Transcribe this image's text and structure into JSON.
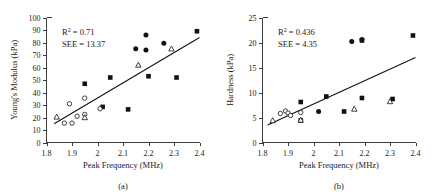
{
  "figure": {
    "panels": [
      {
        "id": "a",
        "caption": "(a)",
        "xlabel": "Peak Frequency (MHz)",
        "ylabel": "Young's Modulus (kPa)",
        "r2_label": "R2 = 0.71",
        "r2_prefix": "R",
        "r2_sup": "2",
        "r2_value": " = 0.71",
        "see_label": "SEE = 13.37",
        "xticks": [
          "1.8",
          "1.9",
          "2",
          "2.1",
          "2.2",
          "2.3",
          "2.4"
        ],
        "yticks": [
          "0",
          "10",
          "20",
          "30",
          "40",
          "50",
          "60",
          "70",
          "80",
          "90",
          "100"
        ]
      },
      {
        "id": "b",
        "caption": "(b)",
        "xlabel": "Peak Frequency (MHz)",
        "ylabel": "Hardness (kPa)",
        "r2_label": "R2 = 0.436",
        "r2_prefix": "R",
        "r2_sup": "2",
        "r2_value": " = 0.436",
        "see_label": "SEE = 4.35",
        "xticks": [
          "1.8",
          "1.9",
          "2",
          "2.1",
          "2.2",
          "2.3",
          "2.4"
        ],
        "yticks": [
          "0",
          "5",
          "10",
          "15",
          "20",
          "25"
        ]
      }
    ]
  },
  "chart_data": [
    {
      "type": "scatter",
      "panel": "a",
      "title": "",
      "xlabel": "Peak Frequency (MHz)",
      "ylabel": "Young's Modulus (kPa)",
      "xlim": [
        1.8,
        2.4
      ],
      "ylim": [
        0,
        100
      ],
      "xticks": [
        1.8,
        1.9,
        2.0,
        2.1,
        2.2,
        2.3,
        2.4
      ],
      "yticks": [
        0,
        10,
        20,
        30,
        40,
        50,
        60,
        70,
        80,
        90,
        100
      ],
      "grid": false,
      "legend": "none",
      "annotations": [
        "R2 = 0.71",
        "SEE = 13.37"
      ],
      "r_squared": 0.71,
      "see": 13.37,
      "fit_line": {
        "x": [
          1.83,
          2.4
        ],
        "y": [
          15.0,
          84.0
        ]
      },
      "series": [
        {
          "name": "filled-square",
          "marker": "filled-square",
          "points": [
            {
              "x": 1.95,
              "y": 47.0
            },
            {
              "x": 2.02,
              "y": 28.5
            },
            {
              "x": 2.05,
              "y": 52.0
            },
            {
              "x": 2.12,
              "y": 26.5
            },
            {
              "x": 2.2,
              "y": 53.0
            },
            {
              "x": 2.31,
              "y": 52.0
            },
            {
              "x": 2.39,
              "y": 89.0
            }
          ]
        },
        {
          "name": "filled-circle",
          "marker": "filled-circle",
          "points": [
            {
              "x": 2.15,
              "y": 75.0
            },
            {
              "x": 2.19,
              "y": 86.0
            },
            {
              "x": 2.19,
              "y": 74.0
            },
            {
              "x": 2.26,
              "y": 79.5
            }
          ]
        },
        {
          "name": "open-circle",
          "marker": "open-circle",
          "points": [
            {
              "x": 1.87,
              "y": 15.5
            },
            {
              "x": 1.89,
              "y": 31.0
            },
            {
              "x": 1.9,
              "y": 15.5
            },
            {
              "x": 1.92,
              "y": 21.0
            },
            {
              "x": 1.95,
              "y": 35.5
            },
            {
              "x": 1.95,
              "y": 22.5
            },
            {
              "x": 2.01,
              "y": 27.0
            }
          ]
        },
        {
          "name": "open-triangle",
          "marker": "open-triangle",
          "points": [
            {
              "x": 1.84,
              "y": 20.5
            },
            {
              "x": 1.95,
              "y": 20.0
            },
            {
              "x": 2.16,
              "y": 62.0
            },
            {
              "x": 2.29,
              "y": 75.0
            }
          ]
        }
      ]
    },
    {
      "type": "scatter",
      "panel": "b",
      "title": "",
      "xlabel": "Peak Frequency (MHz)",
      "ylabel": "Hardness (kPa)",
      "xlim": [
        1.8,
        2.4
      ],
      "ylim": [
        0,
        25
      ],
      "xticks": [
        1.8,
        1.9,
        2.0,
        2.1,
        2.2,
        2.3,
        2.4
      ],
      "yticks": [
        0,
        5,
        10,
        15,
        20,
        25
      ],
      "grid": false,
      "legend": "none",
      "annotations": [
        "R2 = 0.436",
        "SEE = 4.35"
      ],
      "r_squared": 0.436,
      "see": 4.35,
      "fit_line": {
        "x": [
          1.82,
          2.4
        ],
        "y": [
          3.5,
          17.0
        ]
      },
      "series": [
        {
          "name": "filled-square",
          "marker": "filled-square",
          "points": [
            {
              "x": 1.95,
              "y": 8.1
            },
            {
              "x": 1.95,
              "y": 4.4
            },
            {
              "x": 2.05,
              "y": 9.2
            },
            {
              "x": 2.12,
              "y": 6.2
            },
            {
              "x": 2.19,
              "y": 8.9
            },
            {
              "x": 2.19,
              "y": 20.4
            },
            {
              "x": 2.31,
              "y": 8.7
            },
            {
              "x": 2.39,
              "y": 21.4
            }
          ]
        },
        {
          "name": "filled-circle",
          "marker": "filled-circle",
          "points": [
            {
              "x": 2.02,
              "y": 6.2
            },
            {
              "x": 2.15,
              "y": 20.2
            },
            {
              "x": 2.19,
              "y": 20.6
            }
          ]
        },
        {
          "name": "open-circle",
          "marker": "open-circle",
          "points": [
            {
              "x": 1.87,
              "y": 5.8
            },
            {
              "x": 1.89,
              "y": 6.3
            },
            {
              "x": 1.9,
              "y": 5.9
            },
            {
              "x": 1.91,
              "y": 5.4
            },
            {
              "x": 1.95,
              "y": 6.0
            }
          ]
        },
        {
          "name": "open-triangle",
          "marker": "open-triangle",
          "points": [
            {
              "x": 1.84,
              "y": 4.4
            },
            {
              "x": 1.95,
              "y": 4.5
            },
            {
              "x": 2.16,
              "y": 6.7
            },
            {
              "x": 2.3,
              "y": 8.2
            }
          ]
        }
      ]
    }
  ]
}
